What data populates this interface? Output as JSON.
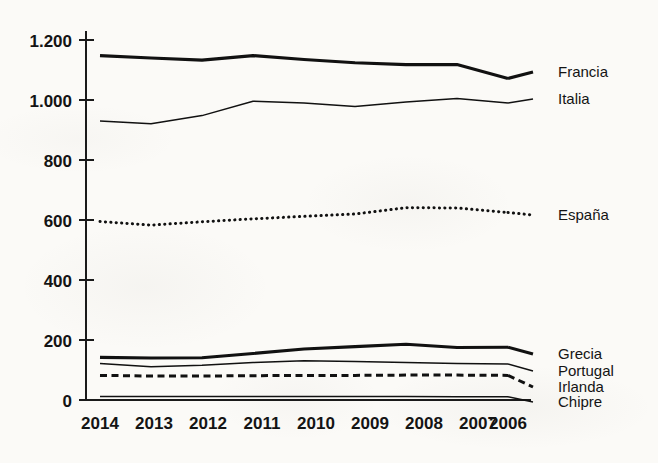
{
  "chart_data": {
    "type": "line",
    "title": "",
    "subtitle": "",
    "xlabel": "",
    "ylabel": "",
    "x": [
      "2014",
      "2013",
      "2012",
      "2011",
      "2010",
      "2009",
      "2008",
      "2007",
      "2006"
    ],
    "categories": [
      "2014",
      "2013",
      "2012",
      "2011",
      "2010",
      "2009",
      "2008",
      "2007",
      "2006"
    ],
    "xlim": [
      "2014",
      "2006"
    ],
    "ylim": [
      0,
      1200
    ],
    "y_ticks": [
      0,
      200,
      400,
      600,
      800,
      1000,
      1200
    ],
    "y_tick_labels": [
      "0",
      "200",
      "400",
      "600",
      "800",
      "1.000",
      "1.200"
    ],
    "grid": false,
    "legend_position": "right-inline",
    "series": [
      {
        "name": "Francia",
        "style": "solid-thick",
        "values": [
          1148,
          1140,
          1133,
          1148,
          1135,
          1124,
          1118,
          1118,
          1072
        ]
      },
      {
        "name": "Italia",
        "style": "solid-thin",
        "values": [
          930,
          921,
          948,
          996,
          990,
          978,
          993,
          1005,
          990
        ]
      },
      {
        "name": "España",
        "style": "dotted",
        "values": [
          595,
          583,
          594,
          604,
          612,
          620,
          641,
          640,
          625
        ]
      },
      {
        "name": "Grecia",
        "style": "solid-thick",
        "values": [
          142,
          140,
          141,
          155,
          170,
          178,
          186,
          175,
          176
        ]
      },
      {
        "name": "Portugal",
        "style": "solid-thin",
        "values": [
          122,
          111,
          116,
          125,
          131,
          128,
          125,
          122,
          120
        ]
      },
      {
        "name": "Irlanda",
        "style": "dashed",
        "values": [
          82,
          80,
          80,
          81,
          82,
          82,
          83,
          83,
          82
        ]
      },
      {
        "name": "Chipre",
        "style": "solid-thin",
        "values": [
          12,
          12,
          12,
          12,
          12,
          12,
          12,
          11,
          11
        ]
      }
    ]
  },
  "axes": {
    "y_tick_labels": [
      "1.200",
      "1.000",
      "800",
      "600",
      "400",
      "200",
      "0"
    ],
    "x_tick_labels": [
      "2014",
      "2013",
      "2012",
      "2011",
      "2010",
      "2009",
      "2008",
      "2007",
      "2006"
    ]
  },
  "legend": {
    "items": [
      {
        "label": "Francia"
      },
      {
        "label": "Italia"
      },
      {
        "label": "España"
      },
      {
        "label": "Grecia"
      },
      {
        "label": "Portugal"
      },
      {
        "label": "Irlanda"
      },
      {
        "label": "Chipre"
      }
    ]
  },
  "colors": {
    "ink": "#111111",
    "axis": "#1a1a1a",
    "paper": "#fbfaf7"
  }
}
